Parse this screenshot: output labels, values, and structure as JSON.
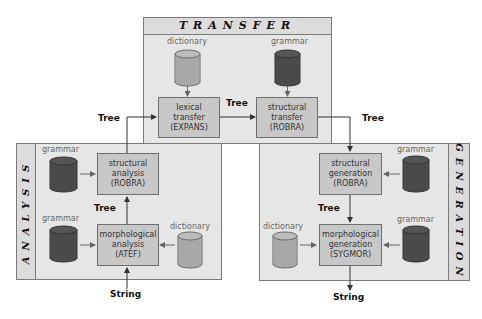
{
  "colors": {
    "panel_bg": "#e6e6e6",
    "header_bg": "#dcdcdc",
    "process_bg": "#c8c8c8",
    "dictionary_cylinder": "#a8a8a8",
    "grammar_cylinder": "#4a4a4a",
    "border": "#7a7a7a",
    "arrow": "#333333"
  },
  "panels": {
    "transfer": {
      "title": "TRANSFER",
      "resources": {
        "dictionary": "dictionary",
        "grammar": "grammar"
      },
      "processes": {
        "lexical": {
          "line1": "lexical",
          "line2": "transfer",
          "line3": "(EXPANS)"
        },
        "structural": {
          "line1": "structural",
          "line2": "transfer",
          "line3": "(ROBRA)"
        }
      },
      "link_label": "Tree"
    },
    "analysis": {
      "title": "ANALYSIS",
      "resources": {
        "grammar_top": "grammar",
        "grammar_bottom": "grammar",
        "dictionary": "dictionary"
      },
      "processes": {
        "structural": {
          "line1": "structural",
          "line2": "analysis",
          "line3": "(ROBRA)"
        },
        "morphological": {
          "line1": "morphological",
          "line2": "analysis",
          "line3": "(ATEF)"
        }
      },
      "link_label": "Tree"
    },
    "generation": {
      "title": "GENERATION",
      "resources": {
        "grammar_top": "grammar",
        "grammar_bottom": "grammar",
        "dictionary": "dictionary"
      },
      "processes": {
        "structural": {
          "line1": "structural",
          "line2": "generation",
          "line3": "(ROBRA)"
        },
        "morphological": {
          "line1": "morphological",
          "line2": "generation",
          "line3": "(SYGMOR)"
        }
      },
      "link_label": "Tree"
    }
  },
  "flows": {
    "analysis_to_transfer": "Tree",
    "transfer_to_generation": "Tree",
    "input": "String",
    "output": "String"
  }
}
